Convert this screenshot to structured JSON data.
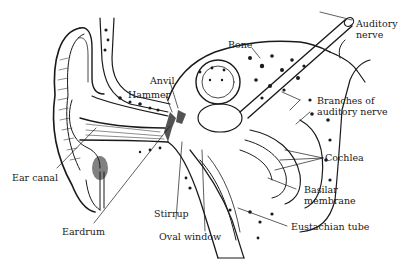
{
  "diagram": {
    "ink_color": "#1a1a1a",
    "background": "#ffffff",
    "labels": [
      {
        "id": "auditory-nerve",
        "line1": "Auditory",
        "line2": "nerve"
      },
      {
        "id": "bone",
        "line1": "Bone"
      },
      {
        "id": "anvil",
        "line1": "Anvil"
      },
      {
        "id": "hammer",
        "line1": "Hammer"
      },
      {
        "id": "branches-of-auditory-nerve",
        "line1": "Branches of",
        "line2": "auditory nerve"
      },
      {
        "id": "cochlea",
        "line1": "Cochlea"
      },
      {
        "id": "ear-canal",
        "line1": "Ear canal"
      },
      {
        "id": "basilar-membrane",
        "line1": "Basilar",
        "line2": "membrane"
      },
      {
        "id": "stirrup",
        "line1": "Stirrup"
      },
      {
        "id": "eardrum",
        "line1": "Eardrum"
      },
      {
        "id": "oval-window",
        "line1": "Oval window"
      },
      {
        "id": "eustachian-tube",
        "line1": "Eustachian tube"
      }
    ]
  }
}
